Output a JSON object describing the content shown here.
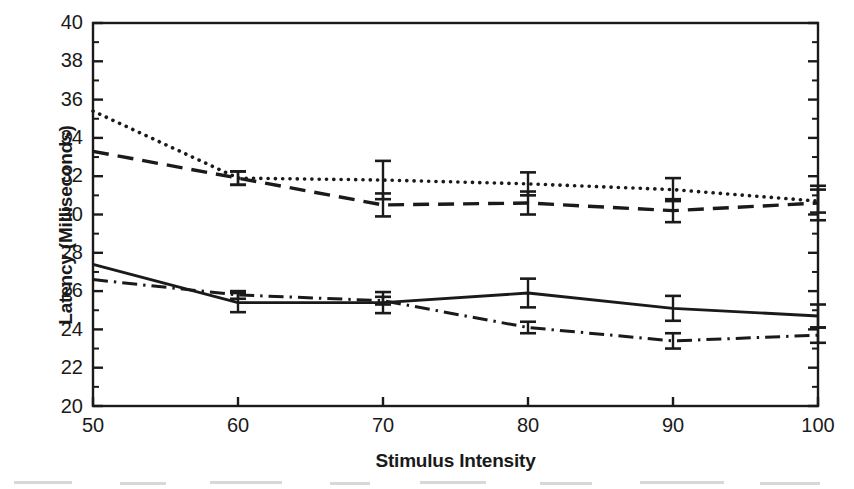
{
  "chart_data": {
    "type": "line",
    "title": "",
    "xlabel": "Stimulus Intensity",
    "ylabel": "Latency (Milliseconds)",
    "x": [
      50,
      60,
      70,
      80,
      90,
      100
    ],
    "xlim": [
      50,
      100
    ],
    "ylim": [
      20,
      40
    ],
    "xticks": [
      "50",
      "60",
      "70",
      "80",
      "90",
      "100"
    ],
    "yticks": [
      "40",
      "38",
      "36",
      "34",
      "32",
      "30",
      "28",
      "26",
      "24",
      "22",
      "20"
    ],
    "grid": false,
    "legend": "none",
    "series": [
      {
        "name": "dotted-series",
        "style": "dotted",
        "values": [
          35.4,
          31.9,
          31.8,
          31.6,
          31.3,
          30.7
        ],
        "errors": [
          null,
          0.35,
          1.0,
          0.6,
          0.6,
          0.6
        ]
      },
      {
        "name": "dashed-series",
        "style": "dashed",
        "values": [
          33.3,
          31.9,
          30.5,
          30.6,
          30.2,
          30.6
        ],
        "errors": [
          null,
          0.35,
          0.6,
          0.6,
          0.6,
          0.9
        ]
      },
      {
        "name": "solid-series",
        "style": "solid",
        "values": [
          27.4,
          25.4,
          25.4,
          25.9,
          25.1,
          24.7
        ],
        "errors": [
          null,
          0.5,
          0.55,
          0.75,
          0.65,
          0.6
        ]
      },
      {
        "name": "dash-dot-series",
        "style": "dash-dot",
        "values": [
          26.6,
          25.8,
          25.5,
          24.1,
          23.4,
          23.7
        ],
        "errors": [
          null,
          0.2,
          0.2,
          0.3,
          0.4,
          0.4
        ]
      }
    ]
  },
  "axes": {
    "ylabel_text": "Latency (Milliseconds)",
    "xlabel_text": "Stimulus Intensity"
  },
  "ytick_labels": [
    "40",
    "38",
    "36",
    "34",
    "32",
    "30",
    "28",
    "26",
    "24",
    "22",
    "20"
  ],
  "xtick_labels": [
    "50",
    "60",
    "70",
    "80",
    "90",
    "100"
  ],
  "colors": {
    "ink": "#1a1a1a",
    "background": "#ffffff"
  }
}
